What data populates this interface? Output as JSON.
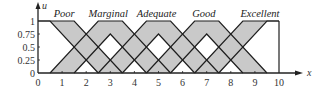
{
  "chart_data": {
    "type": "area",
    "title": "",
    "xlabel": "x",
    "ylabel": "u",
    "xlim": [
      0,
      10
    ],
    "ylim": [
      0,
      1
    ],
    "x_ticks": [
      "0",
      "1",
      "2",
      "3",
      "4",
      "5",
      "6",
      "7",
      "8",
      "9",
      "10"
    ],
    "y_ticks": [
      "0",
      "0.25",
      "0.5",
      "0.75",
      "1"
    ],
    "grid": false,
    "legend": "none (labels placed above each set)",
    "series": [
      {
        "name": "Poor",
        "upper": [
          [
            0,
            1
          ],
          [
            1.5,
            1
          ],
          [
            3.5,
            0
          ]
        ],
        "lower": [
          [
            0,
            1
          ],
          [
            0.5,
            1
          ],
          [
            2.5,
            0
          ]
        ]
      },
      {
        "name": "Marginal",
        "upper": [
          [
            0.5,
            0
          ],
          [
            2.5,
            1
          ],
          [
            3.5,
            1
          ],
          [
            5.5,
            0
          ]
        ],
        "lower": [
          [
            1.5,
            0
          ],
          [
            3,
            0.75
          ],
          [
            4.5,
            0
          ]
        ]
      },
      {
        "name": "Adequate",
        "upper": [
          [
            2.5,
            0
          ],
          [
            4.5,
            1
          ],
          [
            5.5,
            1
          ],
          [
            7.5,
            0
          ]
        ],
        "lower": [
          [
            3.5,
            0
          ],
          [
            5,
            0.75
          ],
          [
            6.5,
            0
          ]
        ]
      },
      {
        "name": "Good",
        "upper": [
          [
            4.5,
            0
          ],
          [
            6.5,
            1
          ],
          [
            7.5,
            1
          ],
          [
            9.5,
            0
          ]
        ],
        "lower": [
          [
            5.5,
            0
          ],
          [
            7,
            0.75
          ],
          [
            8.5,
            0
          ]
        ]
      },
      {
        "name": "Excellent",
        "upper": [
          [
            6.5,
            0
          ],
          [
            8.5,
            1
          ],
          [
            10,
            1
          ]
        ],
        "lower": [
          [
            7.5,
            0
          ],
          [
            9.5,
            1
          ],
          [
            10,
            1
          ]
        ]
      }
    ],
    "labels": [
      {
        "text": "Poor",
        "x": 0.65
      },
      {
        "text": "Marginal",
        "x": 2.1
      },
      {
        "text": "Adequate",
        "x": 4.1
      },
      {
        "text": "Good",
        "x": 6.4
      },
      {
        "text": "Excellent",
        "x": 8.4
      }
    ]
  },
  "style": {
    "fill_color": "#c9c9c9",
    "line_color": "#1e1e1e",
    "axis_color": "#222222"
  }
}
